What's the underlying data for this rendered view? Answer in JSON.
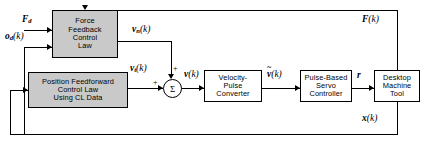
{
  "diagram": {
    "type": "block-diagram",
    "colors": {
      "shaded_block_fill": "#c9c9c9",
      "plain_block_fill": "#ffffff",
      "line": "#000000",
      "background": "#ffffff"
    },
    "blocks": [
      {
        "id": "force_feedback",
        "label": "Force\nFeedback\nControl\nLaw",
        "style": "shaded"
      },
      {
        "id": "position_feedforward",
        "label": "Position Feedforward\nControl Law\nUsing CL Data",
        "style": "shaded"
      },
      {
        "id": "velocity_pulse",
        "label": "Velocity-\nPulse\nConverter",
        "style": "plain"
      },
      {
        "id": "servo_controller",
        "label": "Pulse-Based\nServo\nController",
        "style": "plain"
      },
      {
        "id": "machine_tool",
        "label": "Desktop\nMachine\nTool",
        "style": "plain"
      }
    ],
    "summing_junction": {
      "symbol": "Σ",
      "input_signs": [
        "+",
        "+"
      ]
    },
    "signals": {
      "force_desired": {
        "base": "F",
        "sub": "d",
        "arg": ""
      },
      "offset_desired": {
        "base": "o",
        "sub": "d",
        "arg": "(k)"
      },
      "velocity_normal": {
        "base": "v",
        "sub": "n",
        "arg": "(k)"
      },
      "velocity_tangential": {
        "base": "v",
        "sub": "t",
        "arg": "(k)"
      },
      "velocity_command": {
        "base": "v",
        "sub": "",
        "arg": "(k)"
      },
      "velocity_pulse_cmd": {
        "base": "v",
        "sub": "",
        "arg": "(k)",
        "accent": "~"
      },
      "pulse_rate": {
        "base": "r",
        "sub": "",
        "arg": ""
      },
      "force_measured": {
        "base": "F",
        "sub": "",
        "arg": "(k)"
      },
      "position_measured": {
        "base": "x",
        "sub": "",
        "arg": "(k)"
      }
    }
  }
}
